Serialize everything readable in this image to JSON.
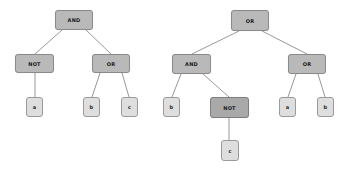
{
  "diagram": {
    "type": "expression-trees",
    "colors": {
      "operator_fill": "#b9b9b9",
      "operator_border": "#8a8a8a",
      "leaf_fill": "#dedede",
      "leaf_border": "#9a9a9a",
      "edge": "#8c8c8c"
    },
    "trees": [
      {
        "name": "left-tree",
        "nodes": {
          "root": {
            "label": "AND"
          },
          "not": {
            "label": "NOT"
          },
          "or": {
            "label": "OR"
          },
          "a": {
            "label": "a"
          },
          "b": {
            "label": "b"
          },
          "c": {
            "label": "c"
          }
        }
      },
      {
        "name": "right-tree",
        "nodes": {
          "root": {
            "label": "OR"
          },
          "and": {
            "label": "AND"
          },
          "or": {
            "label": "OR"
          },
          "b1": {
            "label": "b"
          },
          "not": {
            "label": "NOT"
          },
          "a": {
            "label": "a"
          },
          "b2": {
            "label": "b"
          },
          "c": {
            "label": "c"
          }
        }
      }
    ]
  }
}
